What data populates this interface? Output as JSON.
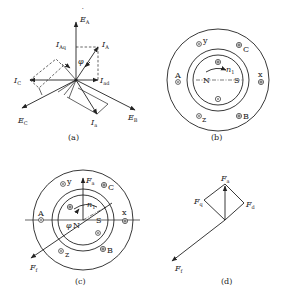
{
  "figure": {
    "panels": [
      {
        "id": "a",
        "caption": "(a)",
        "type": "phasor-diagram",
        "labels": {
          "EA": {
            "main": "E",
            "sub": "A"
          },
          "IAq": {
            "main": "I",
            "sub": "Aq"
          },
          "IA": {
            "main": "I",
            "sub": "A"
          },
          "phi": "φ",
          "IC": {
            "main": "I",
            "sub": "C"
          },
          "Iad": {
            "main": "I",
            "sub": "ad"
          },
          "EC": {
            "main": "E",
            "sub": "C"
          },
          "Ia": {
            "main": "I",
            "sub": "a"
          },
          "EB": {
            "main": "E",
            "sub": "B"
          }
        }
      },
      {
        "id": "b",
        "caption": "(b)",
        "type": "machine-cross-section",
        "labels": {
          "y": "y",
          "C": "C",
          "A": "A",
          "x": "x",
          "N": "N",
          "S": "S",
          "n1": {
            "main": "n",
            "sub": "1"
          },
          "z": "z",
          "B": "B"
        }
      },
      {
        "id": "c",
        "caption": "(c)",
        "type": "machine-cross-section",
        "labels": {
          "Fa": {
            "main": "F",
            "sub": "a"
          },
          "y": "y",
          "C": "C",
          "A": "A",
          "x": "x",
          "n1": {
            "main": "n",
            "sub": "1"
          },
          "S": "S",
          "N": "N",
          "phi": "φ",
          "z": "z",
          "B": "B",
          "Ff": {
            "main": "F",
            "sub": "f"
          }
        }
      },
      {
        "id": "d",
        "caption": "(d)",
        "type": "mmf-phasor-diagram",
        "labels": {
          "Fa": {
            "main": "F",
            "sub": "a"
          },
          "Fq": {
            "main": "F",
            "sub": "q"
          },
          "Fd": {
            "main": "F",
            "sub": "d"
          },
          "Ff": {
            "main": "F",
            "sub": "f"
          }
        }
      }
    ]
  }
}
